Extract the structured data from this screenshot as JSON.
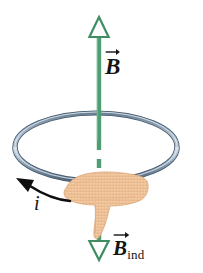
{
  "figure": {
    "canvas": {
      "width": 203,
      "height": 273,
      "background": "#ffffff"
    },
    "labels": {
      "field_symbol": "B",
      "field_arrow_accent": "vector-overbar",
      "induced_symbol": "B",
      "induced_subscript": "ind",
      "current_symbol": "i"
    },
    "colors": {
      "field_green": "#4f9e73",
      "field_green_dark": "#2f7a52",
      "loop_steel": "#7e95ab",
      "loop_steel_dark": "#4d6176",
      "loop_highlight": "#ccd8e2",
      "hand_fill": "#f2c9a0",
      "hand_shade": "#e0ab7c",
      "ink": "#141414"
    },
    "elements": {
      "field_axis": {
        "name": "B field axis arrow",
        "x": 99,
        "top_y": 18,
        "bottom_y": 258,
        "solid_from_y": 30,
        "solid_to_y": 140,
        "dashed_from_y": 140,
        "dashed_to_y": 186,
        "head_up": "hollow-triangle-up",
        "head_down": "hollow-triangle-down"
      },
      "loop": {
        "name": "conducting ring",
        "cx": 96,
        "cy": 147,
        "rx": 81,
        "ry": 34
      },
      "hand": {
        "name": "hand gripping loop",
        "cx": 100,
        "cy": 200
      },
      "current_arrow": {
        "name": "induced current direction",
        "from_x": 68,
        "from_y": 200,
        "to_x": 20,
        "to_y": 180
      }
    }
  }
}
